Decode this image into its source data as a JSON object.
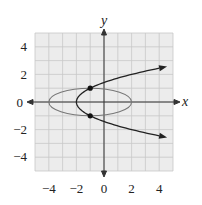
{
  "chart_data": {
    "type": "line",
    "title": "",
    "xlabel": "x",
    "ylabel": "y",
    "xlim": [
      -5,
      5
    ],
    "ylim": [
      -5,
      5
    ],
    "grid": true,
    "x_ticks": [
      -4,
      -2,
      0,
      2,
      4
    ],
    "y_ticks": [
      4,
      2,
      0,
      -2,
      -4
    ],
    "x_tick_labels": [
      "−4",
      "−2",
      "0",
      "2",
      "4"
    ],
    "y_tick_labels": [
      "4",
      "2",
      "0",
      "−2",
      "−4"
    ],
    "series": [
      {
        "name": "ellipse",
        "equation": "(x+1)^2/9 + y^2 = 1",
        "center": [
          -1,
          0
        ],
        "semi_axes": [
          3,
          1
        ],
        "color": "#777777"
      },
      {
        "name": "parabola",
        "equation": "x = y^2 - 2",
        "vertex": [
          -2,
          0
        ],
        "opens": "right",
        "arrows": true,
        "color": "#222222"
      }
    ],
    "points": [
      {
        "label": "intersection-upper",
        "x": -1,
        "y": 1
      },
      {
        "label": "intersection-lower",
        "x": -1,
        "y": -1
      }
    ],
    "legend": null
  },
  "labels": {
    "x_axis": "x",
    "y_axis": "y",
    "xt0": "−4",
    "xt1": "−2",
    "xt2": "0",
    "xt3": "2",
    "xt4": "4",
    "yt0": "4",
    "yt1": "2",
    "yt2": "0",
    "yt3": "−2",
    "yt4": "−4"
  },
  "colors": {
    "grid_bg": "#ececec",
    "grid_line": "#c8c8c8",
    "axis": "#333333",
    "ellipse": "#777777",
    "parabola": "#222222"
  }
}
